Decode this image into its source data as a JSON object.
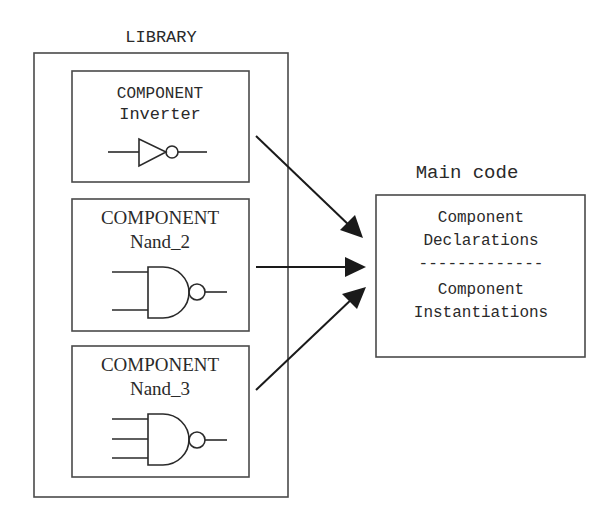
{
  "library": {
    "title": "LIBRARY",
    "components": [
      {
        "keyword": "COMPONENT",
        "name": "Inverter",
        "gate": "inverter-icon",
        "inputs": 1
      },
      {
        "keyword": "COMPONENT",
        "name": "Nand_2",
        "gate": "nand2-gate-icon",
        "inputs": 2
      },
      {
        "keyword": "COMPONENT",
        "name": "Nand_3",
        "gate": "nand3-gate-icon",
        "inputs": 3
      }
    ]
  },
  "main_code": {
    "title": "Main code",
    "line1": "Component",
    "line2": "Declarations",
    "separator": "-------------",
    "line3": "Component",
    "line4": "Instantiations"
  },
  "arrows": [
    {
      "from": "Inverter",
      "to": "Main code"
    },
    {
      "from": "Nand_2",
      "to": "Main code"
    },
    {
      "from": "Nand_3",
      "to": "Main code"
    }
  ]
}
